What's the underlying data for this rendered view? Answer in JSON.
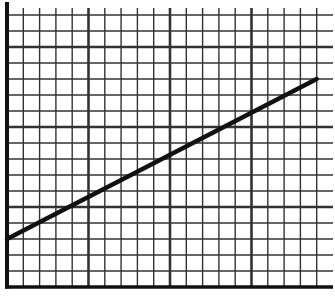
{
  "chart_data": {
    "type": "line",
    "title": "",
    "xlabel": "",
    "ylabel": "",
    "xlim": [
      0,
      20
    ],
    "ylim": [
      0,
      17
    ],
    "grid": true,
    "grid_minor_step": 1,
    "grid_major_step": 5,
    "legend": null,
    "series": [
      {
        "name": "line",
        "x": [
          0,
          19
        ],
        "y": [
          3,
          13
        ]
      }
    ],
    "slope": 0.526,
    "intercept": 3
  },
  "colors": {
    "background": "#ffffff",
    "grid": "#333333",
    "line": "#111111",
    "axis": "#111111"
  }
}
